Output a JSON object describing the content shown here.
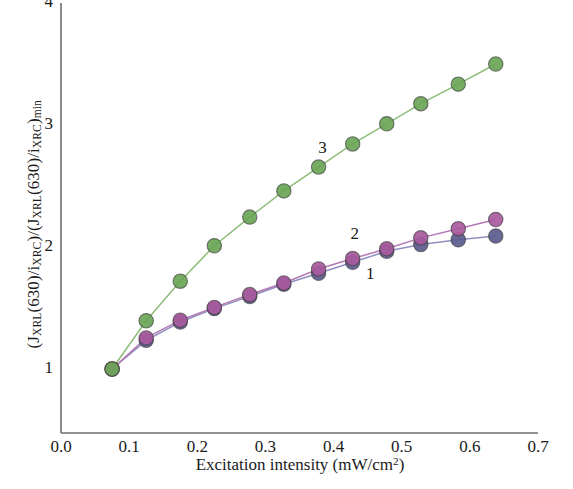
{
  "chart_data": {
    "type": "scatter",
    "title": "",
    "xlabel": "Excitation intensity (mW/cm2)",
    "xlabel_parts": {
      "text": "Excitation intensity (mW/cm",
      "sup": "2",
      "tail": ")"
    },
    "ylabel": "(JXRL(630)/iXRC)/(JXRL(630)/iXRC)min",
    "xlim": [
      0.0,
      0.7
    ],
    "ylim": [
      0.55,
      4.0
    ],
    "xticks": [
      "0.0",
      "0.1",
      "0.2",
      "0.3",
      "0.4",
      "0.5",
      "0.6",
      "0.7"
    ],
    "xtick_values": [
      0.0,
      0.1,
      0.2,
      0.3,
      0.4,
      0.5,
      0.6,
      0.7
    ],
    "yticks": [
      "1",
      "2",
      "3",
      "4"
    ],
    "ytick_values": [
      1,
      2,
      3,
      4
    ],
    "grid": false,
    "legend_position": "inline-annotations",
    "series": [
      {
        "name": "1",
        "label": "1",
        "color": "#5b5b8e",
        "line_color": "#8f8fc0",
        "annotation": {
          "text": "1",
          "x": 0.455,
          "y": 1.77
        },
        "x": [
          0.075,
          0.125,
          0.175,
          0.225,
          0.277,
          0.327,
          0.378,
          0.428,
          0.478,
          0.528,
          0.583,
          0.638
        ],
        "y": [
          1.0,
          1.235,
          1.385,
          1.495,
          1.595,
          1.695,
          1.785,
          1.875,
          1.965,
          2.02,
          2.06,
          2.09
        ]
      },
      {
        "name": "2",
        "label": "2",
        "color": "#a85a9e",
        "line_color": "#b478b4",
        "annotation": {
          "text": "2",
          "x": 0.432,
          "y": 2.1
        },
        "x": [
          0.075,
          0.125,
          0.175,
          0.225,
          0.277,
          0.327,
          0.378,
          0.428,
          0.478,
          0.528,
          0.583,
          0.638
        ],
        "y": [
          1.0,
          1.255,
          1.4,
          1.505,
          1.61,
          1.705,
          1.82,
          1.905,
          1.985,
          2.075,
          2.15,
          2.225
        ]
      },
      {
        "name": "3",
        "label": "3",
        "color": "#6aa556",
        "line_color": "#8cbd78",
        "annotation": {
          "text": "3",
          "x": 0.385,
          "y": 2.8
        },
        "x": [
          0.075,
          0.125,
          0.175,
          0.225,
          0.277,
          0.327,
          0.378,
          0.428,
          0.478,
          0.528,
          0.583,
          0.638
        ],
        "y": [
          1.0,
          1.395,
          1.72,
          2.01,
          2.245,
          2.46,
          2.655,
          2.845,
          3.01,
          3.175,
          3.335,
          3.5
        ]
      }
    ]
  },
  "axes": {
    "axis_color": "#6e6e6e",
    "marker_edge_color": "#3a3a3a"
  }
}
